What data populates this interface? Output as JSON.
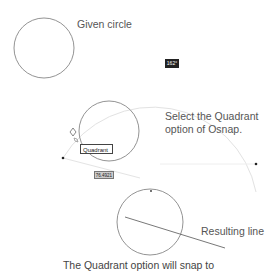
{
  "labels": {
    "given_circle": "Given circle",
    "select_quadrant_line1": "Select the Quadrant",
    "select_quadrant_line2": "option of Osnap.",
    "resulting_line": "Resulting line",
    "caption": "The Quadrant option will snap to"
  },
  "tooltips": {
    "angle": "162°",
    "osnap_marker": "Quadrant",
    "coordinate": "76.4921"
  },
  "colors": {
    "stroke": "#666666",
    "arc": "#dddddd",
    "text": "#555555"
  }
}
